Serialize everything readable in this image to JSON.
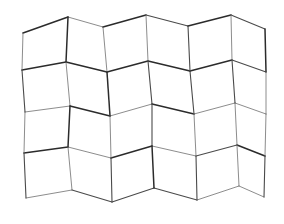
{
  "figure": {
    "type": "line-drawing",
    "background_color": "#ffffff",
    "canvas": {
      "width": 284,
      "height": 224
    },
    "rows": 4,
    "columns": 6,
    "cell_count": 24,
    "stroke_colors": {
      "dark": "#2b2b2b",
      "medium": "#4a4a4a",
      "light": "#6e6e6e"
    },
    "stroke_widths": {
      "thick": 1.5,
      "medium": 1.1,
      "thin": 0.8
    },
    "bounds": {
      "left": 22,
      "top": 14,
      "right": 266,
      "bottom": 206
    }
  },
  "chart_data": {
    "type": "line",
    "xlabel": "",
    "ylabel": "",
    "grid": false,
    "legend_position": "none",
    "xlim": [
      0,
      284
    ],
    "ylim": [
      224,
      0
    ],
    "rows": 4,
    "columns": 6,
    "note": "Vertices are pixel coordinates of the mesh lattice, 5 horizontal node rows by 7 vertical node columns. Rows alternate horizontal offset, creating the zigzag.",
    "vertices": [
      [
        [
          23,
          33
        ],
        [
          68,
          17
        ],
        [
          103,
          27
        ],
        [
          146,
          15
        ],
        [
          188,
          26
        ],
        [
          231,
          15
        ],
        [
          265,
          29
        ]
      ],
      [
        [
          22,
          70
        ],
        [
          66,
          62
        ],
        [
          107,
          72
        ],
        [
          148,
          61
        ],
        [
          190,
          71
        ],
        [
          232,
          60
        ],
        [
          266,
          72
        ]
      ],
      [
        [
          25,
          112
        ],
        [
          70,
          106
        ],
        [
          110,
          116
        ],
        [
          152,
          104
        ],
        [
          194,
          114
        ],
        [
          235,
          103
        ],
        [
          266,
          114
        ]
      ],
      [
        [
          24,
          153
        ],
        [
          68,
          147
        ],
        [
          111,
          158
        ],
        [
          152,
          146
        ],
        [
          196,
          156
        ],
        [
          237,
          145
        ],
        [
          265,
          156
        ]
      ],
      [
        [
          26,
          198
        ],
        [
          72,
          190
        ],
        [
          112,
          202
        ],
        [
          154,
          188
        ],
        [
          197,
          200
        ],
        [
          239,
          186
        ],
        [
          264,
          197
        ]
      ]
    ],
    "horizontal_edges": [
      {
        "row": 0,
        "points": [
          [
            23,
            33
          ],
          [
            68,
            17
          ],
          [
            103,
            27
          ],
          [
            146,
            15
          ],
          [
            188,
            26
          ],
          [
            231,
            15
          ],
          [
            265,
            29
          ]
        ]
      },
      {
        "row": 1,
        "points": [
          [
            22,
            70
          ],
          [
            66,
            62
          ],
          [
            107,
            72
          ],
          [
            148,
            61
          ],
          [
            190,
            71
          ],
          [
            232,
            60
          ],
          [
            266,
            72
          ]
        ]
      },
      {
        "row": 2,
        "points": [
          [
            25,
            112
          ],
          [
            70,
            106
          ],
          [
            110,
            116
          ],
          [
            152,
            104
          ],
          [
            194,
            114
          ],
          [
            235,
            103
          ],
          [
            266,
            114
          ]
        ]
      },
      {
        "row": 3,
        "points": [
          [
            24,
            153
          ],
          [
            68,
            147
          ],
          [
            111,
            158
          ],
          [
            152,
            146
          ],
          [
            196,
            156
          ],
          [
            237,
            145
          ],
          [
            265,
            156
          ]
        ]
      },
      {
        "row": 4,
        "points": [
          [
            26,
            198
          ],
          [
            72,
            190
          ],
          [
            112,
            202
          ],
          [
            154,
            188
          ],
          [
            197,
            200
          ],
          [
            239,
            186
          ],
          [
            264,
            197
          ]
        ]
      }
    ],
    "vertical_edges": [
      {
        "column": 0,
        "points": [
          [
            23,
            33
          ],
          [
            22,
            70
          ],
          [
            25,
            112
          ],
          [
            24,
            153
          ],
          [
            26,
            198
          ]
        ]
      },
      {
        "column": 1,
        "points": [
          [
            68,
            17
          ],
          [
            66,
            62
          ],
          [
            70,
            106
          ],
          [
            68,
            147
          ],
          [
            72,
            190
          ]
        ]
      },
      {
        "column": 2,
        "points": [
          [
            103,
            27
          ],
          [
            107,
            72
          ],
          [
            110,
            116
          ],
          [
            111,
            158
          ],
          [
            112,
            202
          ]
        ]
      },
      {
        "column": 3,
        "points": [
          [
            146,
            15
          ],
          [
            148,
            61
          ],
          [
            152,
            104
          ],
          [
            152,
            146
          ],
          [
            154,
            188
          ]
        ]
      },
      {
        "column": 4,
        "points": [
          [
            188,
            26
          ],
          [
            190,
            71
          ],
          [
            194,
            114
          ],
          [
            196,
            156
          ],
          [
            197,
            200
          ]
        ]
      },
      {
        "column": 5,
        "points": [
          [
            231,
            15
          ],
          [
            232,
            60
          ],
          [
            235,
            103
          ],
          [
            237,
            145
          ],
          [
            239,
            186
          ]
        ]
      },
      {
        "column": 6,
        "points": [
          [
            265,
            29
          ],
          [
            266,
            72
          ],
          [
            266,
            114
          ],
          [
            265,
            156
          ],
          [
            264,
            197
          ]
        ]
      }
    ]
  }
}
